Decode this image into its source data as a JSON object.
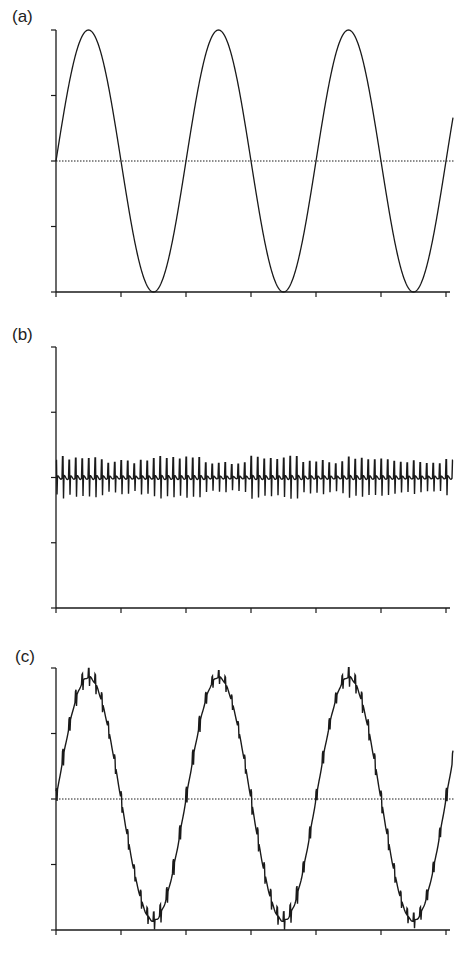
{
  "chart_data": [
    {
      "type": "line",
      "panel_label": "(a)",
      "title": "",
      "description": "Pure sinusoidal signal",
      "xlabel": "",
      "ylabel": "",
      "x_ticks": 7,
      "y_ticks": 5,
      "ylim": [
        -1,
        1
      ],
      "xlim": [
        0,
        6.1
      ],
      "grid": false,
      "zero_line": "dotted",
      "signal": {
        "amplitude": 1.0,
        "period_ticks": 2.0,
        "phase": 0,
        "noise_amplitude": 0.0,
        "noise_period_ticks": 0.1
      },
      "series": [
        {
          "name": "signal",
          "x": [
            0,
            0.5,
            1,
            1.5,
            2,
            2.5,
            3,
            3.5,
            4,
            4.5,
            5,
            5.5,
            6,
            6.1
          ],
          "values": [
            0,
            1,
            0,
            -1,
            0,
            1,
            0,
            -1,
            0,
            1,
            0,
            -1,
            0,
            0.31
          ]
        }
      ]
    },
    {
      "type": "line",
      "panel_label": "(b)",
      "title": "",
      "description": "High-frequency noise",
      "xlabel": "",
      "ylabel": "",
      "x_ticks": 7,
      "y_ticks": 5,
      "ylim": [
        -1,
        1
      ],
      "xlim": [
        0,
        6.1
      ],
      "grid": false,
      "zero_line": "solid",
      "signal": {
        "amplitude": 0.0,
        "period_ticks": 2.0,
        "phase": 0,
        "noise_amplitude": 0.13,
        "noise_period_ticks": 0.1
      },
      "series": [
        {
          "name": "noise",
          "x": [
            0,
            6.1
          ],
          "values_range": [
            -0.13,
            0.13
          ]
        }
      ]
    },
    {
      "type": "line",
      "panel_label": "(c)",
      "title": "",
      "description": "Sinusoidal signal plus noise (sum of a and b)",
      "xlabel": "",
      "ylabel": "",
      "x_ticks": 7,
      "y_ticks": 5,
      "ylim": [
        -1,
        1
      ],
      "xlim": [
        0,
        6.1
      ],
      "grid": false,
      "zero_line": "dotted",
      "signal": {
        "amplitude": 0.93,
        "period_ticks": 2.0,
        "phase": 0,
        "noise_amplitude": 0.06,
        "noise_period_ticks": 0.1
      },
      "series": [
        {
          "name": "signal+noise",
          "x": [
            0,
            0.5,
            1,
            1.5,
            2,
            2.5,
            3,
            3.5,
            4,
            4.5,
            5,
            5.5,
            6,
            6.1
          ],
          "values": [
            0,
            0.93,
            0,
            -0.93,
            0,
            0.93,
            0,
            -0.93,
            0,
            0.93,
            0,
            -0.93,
            0,
            0.29
          ]
        }
      ]
    }
  ],
  "layout": {
    "panels": [
      {
        "id": "a",
        "label_x": 12,
        "label_y": 22,
        "top": 30,
        "bottom": 292
      },
      {
        "id": "b",
        "label_x": 12,
        "label_y": 340,
        "top": 347,
        "bottom": 608
      },
      {
        "id": "c",
        "label_x": 15,
        "label_y": 662,
        "top": 668,
        "bottom": 930
      }
    ],
    "x_left": 56,
    "tick_spacing": 65,
    "x_end": 453,
    "color": "#1a1a1a"
  }
}
